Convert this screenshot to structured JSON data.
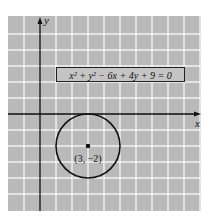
{
  "figure": {
    "equation": "x² + y² − 6x + 4y + 9 = 0",
    "center_label": "(3, −2)",
    "x_axis_label": "x",
    "y_axis_label": "y",
    "center": [
      3,
      -2
    ],
    "radius": 2,
    "grid": {
      "x_range": [
        -2,
        10
      ],
      "y_range": [
        6,
        -6
      ],
      "unit_px": 16
    },
    "colors": {
      "grid_bg": "#b9b9b9",
      "grid_line": "#f2f2f2",
      "stroke": "#111111"
    }
  }
}
